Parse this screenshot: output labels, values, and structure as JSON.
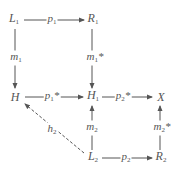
{
  "nodes": {
    "L1": {
      "base": "L",
      "sub": "1"
    },
    "R1": {
      "base": "R",
      "sub": "1"
    },
    "H": {
      "base": "H",
      "sub": ""
    },
    "H1": {
      "base": "H",
      "sub": "1"
    },
    "X": {
      "base": "X",
      "sub": ""
    },
    "L2": {
      "base": "L",
      "sub": "2"
    },
    "R2": {
      "base": "R",
      "sub": "2"
    }
  },
  "edges": {
    "p1": {
      "from": "L1",
      "to": "R1",
      "base": "p",
      "sub": "1",
      "sup": "",
      "style": "solid"
    },
    "m1": {
      "from": "L1",
      "to": "H",
      "base": "m",
      "sub": "1",
      "sup": "",
      "style": "solid"
    },
    "m1s": {
      "from": "R1",
      "to": "H1",
      "base": "m",
      "sub": "1",
      "sup": "*",
      "style": "solid"
    },
    "p1s": {
      "from": "H",
      "to": "H1",
      "base": "p",
      "sub": "1",
      "sup": "*",
      "style": "solid"
    },
    "p2s": {
      "from": "H1",
      "to": "X",
      "base": "p",
      "sub": "2",
      "sup": "*",
      "style": "solid"
    },
    "m2": {
      "from": "L2",
      "to": "H1",
      "base": "m",
      "sub": "2",
      "sup": "",
      "style": "solid"
    },
    "m2s": {
      "from": "R2",
      "to": "X",
      "base": "m",
      "sub": "2",
      "sup": "*",
      "style": "solid"
    },
    "p2": {
      "from": "L2",
      "to": "R2",
      "base": "p",
      "sub": "2",
      "sup": "",
      "style": "solid"
    },
    "h2": {
      "from": "L2",
      "to": "H",
      "base": "h",
      "sub": "2",
      "sup": "",
      "style": "dashed"
    }
  },
  "colors": {
    "line": "#555555",
    "text": "#555555",
    "background": "#ffffff"
  }
}
